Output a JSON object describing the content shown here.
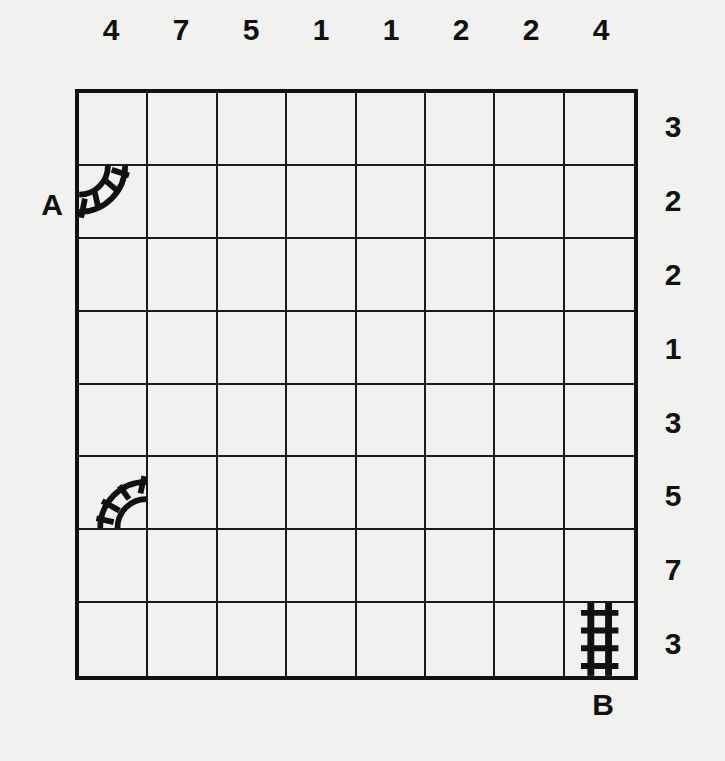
{
  "puzzle": {
    "type": "train-tracks",
    "rows": 8,
    "cols": 8,
    "column_clues": [
      "4",
      "7",
      "5",
      "1",
      "1",
      "2",
      "2",
      "4"
    ],
    "row_clues": [
      "3",
      "2",
      "2",
      "1",
      "3",
      "5",
      "7",
      "3"
    ],
    "start_label": "A",
    "end_label": "B",
    "given_tracks": [
      {
        "row": 2,
        "col": 1,
        "piece": "curve",
        "connects": [
          "left",
          "top"
        ],
        "icon": "track-curve-left-top-icon"
      },
      {
        "row": 6,
        "col": 1,
        "piece": "curve",
        "connects": [
          "right",
          "bottom"
        ],
        "icon": "track-curve-right-bottom-icon"
      },
      {
        "row": 8,
        "col": 8,
        "piece": "straight",
        "connects": [
          "top",
          "bottom"
        ],
        "icon": "track-straight-vertical-icon"
      }
    ],
    "colors": {
      "background": "#f1f1f0",
      "ink": "#111111"
    }
  }
}
